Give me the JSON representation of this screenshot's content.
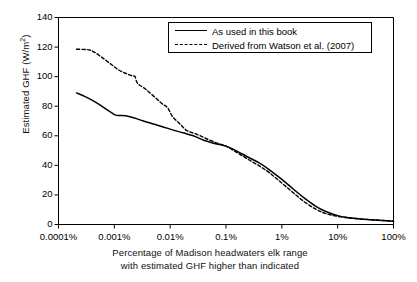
{
  "chart_data": {
    "type": "line",
    "title": "",
    "xlabel": "Percentage of  Madison headwaters elk range with estimated GHF higher than indicated",
    "xlabel_line1": "Percentage of  Madison headwaters elk range",
    "xlabel_line2": "with estimated GHF higher than indicated",
    "ylabel": "Estimated GHF (W/m2)",
    "ylabel_main": "Estimated GHF (W/m",
    "ylabel_sup": "2",
    "ylabel_close": ")",
    "xscale": "log",
    "xlim": [
      0.0001,
      100
    ],
    "ylim": [
      0,
      140
    ],
    "yticks": [
      0,
      20,
      40,
      60,
      80,
      100,
      120,
      140
    ],
    "ytick_labels": [
      "0",
      "20",
      "40",
      "60",
      "80",
      "100",
      "120",
      "140"
    ],
    "xticks": [
      0.0001,
      0.001,
      0.01,
      0.1,
      1,
      10,
      100
    ],
    "xtick_labels": [
      "0.0001%",
      "0.001%",
      "0.01%",
      "0.1%",
      "1%",
      "10%",
      "100%"
    ],
    "grid": false,
    "legend_position": "top-center",
    "line_color": "#000000",
    "series": [
      {
        "name": "As used in this book",
        "style": "solid",
        "points": [
          [
            0.00021,
            89.0
          ],
          [
            0.0003,
            86.5
          ],
          [
            0.00045,
            83.0
          ],
          [
            0.00065,
            79.0
          ],
          [
            0.0009,
            75.5
          ],
          [
            0.0011,
            73.8
          ],
          [
            0.0016,
            73.5
          ],
          [
            0.0023,
            72.0
          ],
          [
            0.0033,
            70.0
          ],
          [
            0.005,
            68.0
          ],
          [
            0.0075,
            66.0
          ],
          [
            0.011,
            64.0
          ],
          [
            0.017,
            62.0
          ],
          [
            0.026,
            60.0
          ],
          [
            0.04,
            57.0
          ],
          [
            0.06,
            55.0
          ],
          [
            0.1,
            53.0
          ],
          [
            0.16,
            49.5
          ],
          [
            0.25,
            45.5
          ],
          [
            0.4,
            41.5
          ],
          [
            0.6,
            37.0
          ],
          [
            1.0,
            30.5
          ],
          [
            1.6,
            24.0
          ],
          [
            2.5,
            18.0
          ],
          [
            4.0,
            12.5
          ],
          [
            6.0,
            9.0
          ],
          [
            10.0,
            6.0
          ],
          [
            16.0,
            4.6
          ],
          [
            25.0,
            3.8
          ],
          [
            40.0,
            3.2
          ],
          [
            60.0,
            2.7
          ],
          [
            100.0,
            2.2
          ]
        ]
      },
      {
        "name": "Derived from Watson et al. (2007)",
        "style": "dashed",
        "points": [
          [
            0.00021,
            118.5
          ],
          [
            0.00032,
            118.3
          ],
          [
            0.00042,
            117.0
          ],
          [
            0.0006,
            113.0
          ],
          [
            0.0009,
            108.0
          ],
          [
            0.0012,
            104.5
          ],
          [
            0.00165,
            102.0
          ],
          [
            0.0021,
            100.5
          ],
          [
            0.00235,
            100.0
          ],
          [
            0.0026,
            95.5
          ],
          [
            0.0035,
            92.0
          ],
          [
            0.005,
            87.0
          ],
          [
            0.007,
            82.0
          ],
          [
            0.009,
            79.0
          ],
          [
            0.011,
            73.0
          ],
          [
            0.015,
            68.0
          ],
          [
            0.02,
            63.5
          ],
          [
            0.03,
            61.0
          ],
          [
            0.045,
            58.0
          ],
          [
            0.07,
            55.0
          ],
          [
            0.1,
            53.0
          ],
          [
            0.16,
            48.5
          ],
          [
            0.25,
            44.0
          ],
          [
            0.4,
            39.5
          ],
          [
            0.6,
            35.0
          ],
          [
            1.0,
            28.0
          ],
          [
            1.6,
            21.5
          ],
          [
            2.5,
            15.5
          ],
          [
            4.0,
            10.5
          ],
          [
            6.0,
            7.5
          ],
          [
            10.0,
            5.5
          ],
          [
            16.0,
            4.4
          ],
          [
            25.0,
            3.8
          ],
          [
            40.0,
            3.2
          ],
          [
            60.0,
            2.8
          ],
          [
            100.0,
            2.3
          ]
        ]
      }
    ]
  }
}
